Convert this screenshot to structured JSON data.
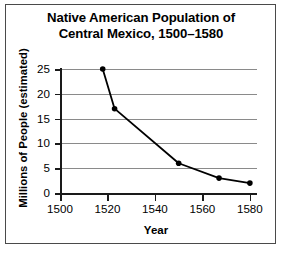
{
  "chart_data": {
    "type": "line",
    "title": "Native American Population of Central Mexico, 1500–1580",
    "title_lines": [
      "Native American Population of",
      "Central Mexico, 1500–1580"
    ],
    "xlabel": "Year",
    "ylabel": "Millions of People (estimated)",
    "xlim": [
      1500,
      1583
    ],
    "ylim": [
      0,
      25
    ],
    "xticks": [
      1500,
      1520,
      1540,
      1560,
      1580
    ],
    "xtick_labels": [
      "1500",
      "1520",
      "1540",
      "1560",
      "1580"
    ],
    "yticks": [
      0,
      5,
      10,
      15,
      20,
      25
    ],
    "ytick_labels": [
      "0",
      "5",
      "10",
      "15",
      "20",
      "25"
    ],
    "grid": "horizontal",
    "legend": "none",
    "marker": "filled-circle",
    "line_color": "#000000",
    "grid_color": "#8a8a8a",
    "axis_color": "#1a1a1a",
    "x": [
      1518,
      1523,
      1550,
      1567,
      1580
    ],
    "values": [
      25,
      17,
      6,
      3,
      2
    ],
    "points": [
      {
        "year": 1518,
        "population": 25
      },
      {
        "year": 1523,
        "population": 17
      },
      {
        "year": 1550,
        "population": 6
      },
      {
        "year": 1567,
        "population": 3
      },
      {
        "year": 1580,
        "population": 2
      }
    ]
  }
}
